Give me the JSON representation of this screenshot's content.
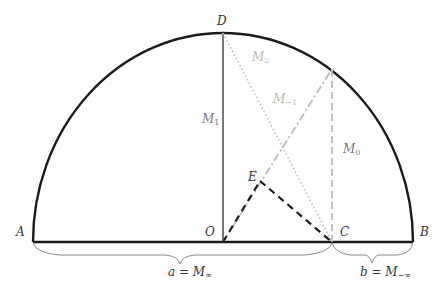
{
  "points": {
    "A": {
      "label": "A",
      "x": 33,
      "y": 242
    },
    "B": {
      "label": "B",
      "x": 413,
      "y": 242
    },
    "O": {
      "label": "O",
      "x": 223,
      "y": 242
    },
    "C": {
      "label": "C",
      "x": 332,
      "y": 242
    },
    "D": {
      "label": "D",
      "x": 223,
      "y": 33
    },
    "E": {
      "label": "E",
      "x": 260,
      "y": 181
    }
  },
  "segment_labels": {
    "M1": {
      "base": "M",
      "sub": "1"
    },
    "M0": {
      "base": "M",
      "sub": "0"
    },
    "M2": {
      "base": "M",
      "sub": "2"
    },
    "Mm1": {
      "base": "M",
      "sub": "−1"
    }
  },
  "braces": {
    "left": {
      "base": "a = M",
      "sub": "∞"
    },
    "right": {
      "base": "b = M",
      "sub": "−∞"
    }
  },
  "colors": {
    "arc": "#1a1a1a",
    "diameter": "#1a1a1a",
    "od": "#777777",
    "light": "#bbbbbb",
    "dashed": "#1a1a1a"
  }
}
